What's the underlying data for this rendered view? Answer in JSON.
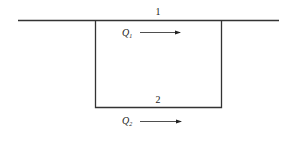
{
  "diagram": {
    "type": "parallel-pipe-network",
    "colors": {
      "line": "#333333",
      "text": "#222222",
      "background": "#ffffff"
    },
    "pipes": [
      {
        "id": "pipe-1",
        "label": "1"
      },
      {
        "id": "pipe-2",
        "label": "2"
      }
    ],
    "flows": [
      {
        "id": "flow-1",
        "symbol": "Q",
        "subscript": "1",
        "direction": "right"
      },
      {
        "id": "flow-2",
        "symbol": "Q",
        "subscript": "2",
        "direction": "right"
      }
    ]
  }
}
